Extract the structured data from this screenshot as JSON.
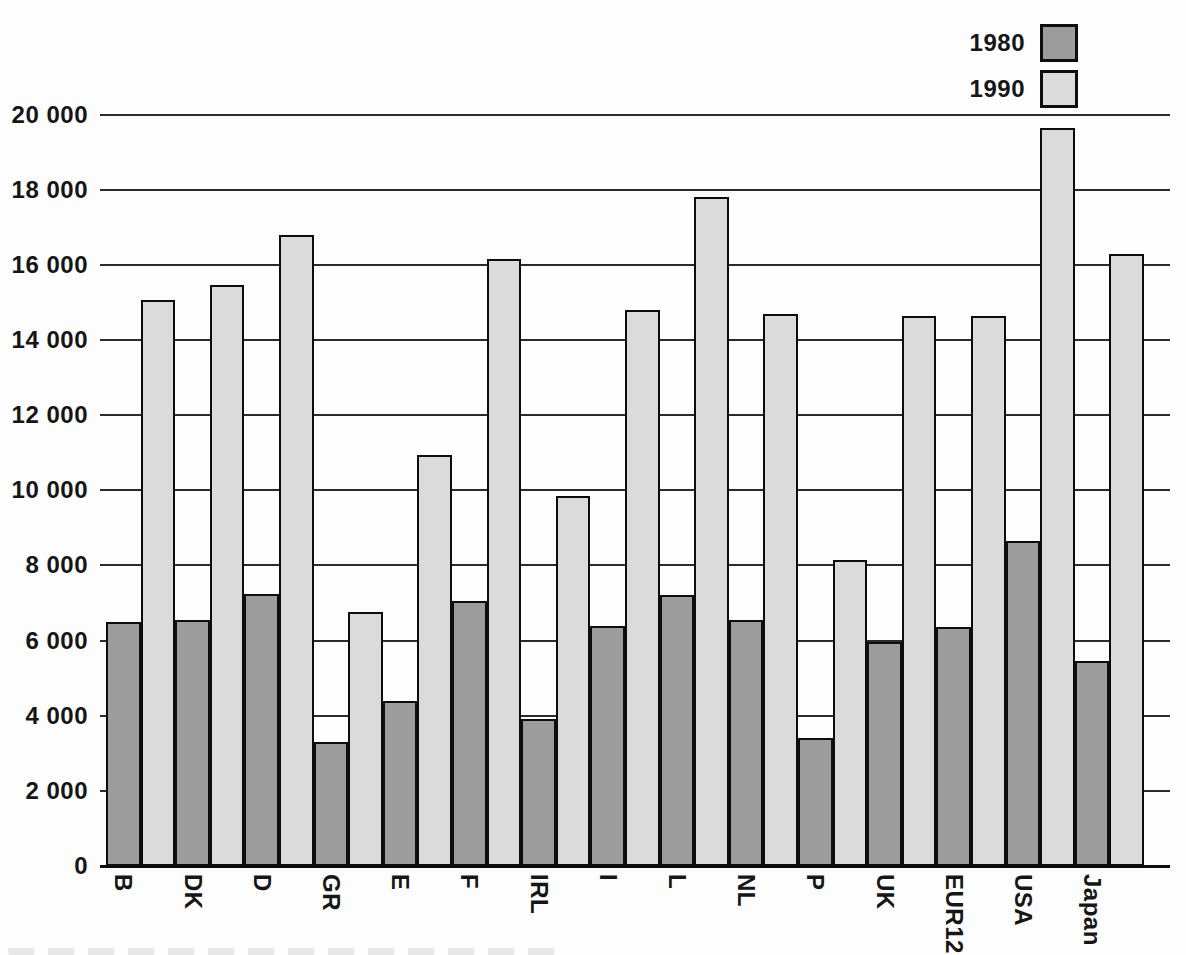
{
  "legend": {
    "items": [
      {
        "label": "1980",
        "color": "#9c9c9c"
      },
      {
        "label": "1990",
        "color": "#dbdbdb"
      }
    ]
  },
  "chart_data": {
    "type": "bar",
    "title": "",
    "categories": [
      "B",
      "DK",
      "D",
      "GR",
      "E",
      "F",
      "IRL",
      "I",
      "L",
      "NL",
      "P",
      "UK",
      "EUR12",
      "USA",
      "Japan"
    ],
    "series": [
      {
        "name": "1980",
        "color": "#9c9c9c",
        "values": [
          6500,
          6550,
          7250,
          3300,
          4400,
          7050,
          3900,
          6400,
          7200,
          6550,
          3400,
          5950,
          6350,
          8650,
          5450
        ]
      },
      {
        "name": "1990",
        "color": "#dbdbdb",
        "values": [
          15050,
          15450,
          16800,
          6750,
          10950,
          16150,
          9850,
          14800,
          17800,
          14700,
          8150,
          14650,
          14650,
          19650,
          16300
        ]
      }
    ],
    "xlabel": "",
    "ylabel": "",
    "ylim": [
      0,
      20000
    ],
    "ytick_interval": 2000,
    "ytick_labels": [
      "0",
      "2 000",
      "4 000",
      "6 000",
      "8 000",
      "10 000",
      "12 000",
      "14 000",
      "16 000",
      "18 000",
      "20 000"
    ],
    "grid": "horizontal",
    "gridlines_behind_bars": true,
    "legend_position": "top-right",
    "bar_orientation": "vertical",
    "x_label_rotation": "vertical"
  }
}
